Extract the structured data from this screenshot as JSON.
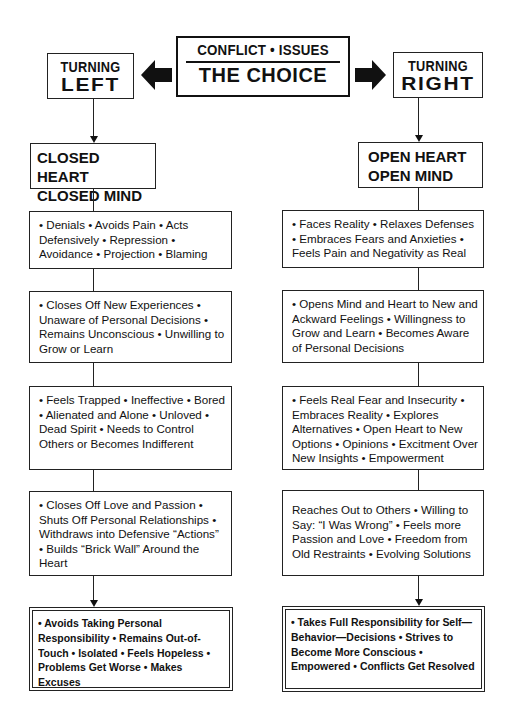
{
  "header": {
    "center": {
      "top": "CONFLICT • ISSUES",
      "main": "THE CHOICE"
    },
    "left": {
      "top": "TURNING",
      "main": "LEFT"
    },
    "right": {
      "top": "TURNING",
      "main": "RIGHT"
    },
    "icons": {
      "left_arrow": "arrow-left-icon",
      "right_arrow": "arrow-right-icon"
    }
  },
  "left_column": {
    "heading": {
      "line1": "CLOSED HEART",
      "line2": "CLOSED MIND"
    },
    "boxes": [
      "• Denials • Avoids Pain • Acts Defensively • Repression • Avoidance • Projection • Blaming",
      "• Closes Off New Experiences • Unaware of Personal Decisions • Remains Unconscious • Unwilling to Grow or Learn",
      "• Feels Trapped • Ineffective • Bored • Alienated and Alone • Unloved • Dead Spirit • Needs to Control Others or Becomes Indifferent",
      "• Closes Off Love and Passion • Shuts Off Personal Relationships • Withdraws into Defensive “Actions” • Builds “Brick Wall” Around the Heart"
    ],
    "outcome": "• Avoids Taking Personal Responsibility • Remains Out-of-Touch • Isolated • Feels Hopeless • Problems Get Worse • Makes Excuses"
  },
  "right_column": {
    "heading": {
      "line1": "OPEN HEART",
      "line2": "OPEN MIND"
    },
    "boxes": [
      "• Faces Reality •  Relaxes Defenses • Embraces Fears and Anxieties • Feels Pain and Negativity as Real",
      "• Opens Mind and Heart to New and Ackward Feelings • Willingness to Grow and Learn • Becomes Aware of Personal Decisions",
      "•  Feels Real Fear and Insecurity •  Embraces Reality • Explores Alternatives • Open Heart to New Options • Opinions • Excitment Over New Insights • Empowerment",
      "Reaches Out to Others • Willing to Say: “I Was Wrong” • Feels more Passion and Love •  Freedom from Old Restraints • Evolving Solutions"
    ],
    "outcome": "•  Takes Full Responsibility for Self—Behavior—Decisions • Strives to Become More Conscious • Empowered • Conflicts Get Resolved"
  }
}
